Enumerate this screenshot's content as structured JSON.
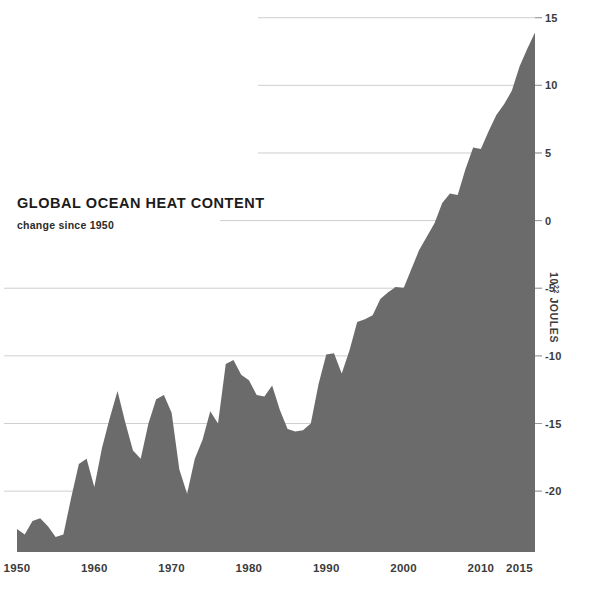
{
  "title": "GLOBAL OCEAN HEAT CONTENT",
  "subtitle": "change since 1950",
  "axis": {
    "y_label_prefix": "10",
    "y_label_exp": "22",
    "y_label_suffix": " JOULES",
    "y_label_full": "10²² JOULES"
  },
  "colors": {
    "fill": "#6b6b6b",
    "gridline": "#cfcfcf",
    "gridline_over_fill": "#4f4f4f",
    "text": "#3b3b3b",
    "title": "#1c1c1c",
    "background": "#ffffff"
  },
  "chart_data": {
    "type": "area",
    "title": "GLOBAL OCEAN HEAT CONTENT",
    "subtitle": "change since 1950",
    "xlabel": "",
    "ylabel": "10²² JOULES",
    "xlim": [
      1950,
      2017
    ],
    "ylim": [
      -24.5,
      15.2
    ],
    "grid": true,
    "legend": null,
    "xticks": [
      1950,
      1960,
      1970,
      1980,
      1990,
      2000,
      2010,
      2015
    ],
    "xtick_labels": [
      "1950",
      "1960",
      "1970",
      "1980",
      "1990",
      "2000",
      "2010",
      "2015"
    ],
    "yticks": [
      15,
      10,
      5,
      0,
      -5,
      -10,
      -15,
      -20
    ],
    "ytick_labels": [
      "15",
      "10",
      "5",
      "0",
      "-5",
      "-10",
      "-15",
      "-20"
    ],
    "x": [
      1950,
      1951,
      1952,
      1953,
      1954,
      1955,
      1956,
      1957,
      1958,
      1959,
      1960,
      1961,
      1962,
      1963,
      1964,
      1965,
      1966,
      1967,
      1968,
      1969,
      1970,
      1971,
      1972,
      1973,
      1974,
      1975,
      1976,
      1977,
      1978,
      1979,
      1980,
      1981,
      1982,
      1983,
      1984,
      1985,
      1986,
      1987,
      1988,
      1989,
      1990,
      1991,
      1992,
      1993,
      1994,
      1995,
      1996,
      1997,
      1998,
      1999,
      2000,
      2001,
      2002,
      2003,
      2004,
      2005,
      2006,
      2007,
      2008,
      2009,
      2010,
      2011,
      2012,
      2013,
      2014,
      2015,
      2016,
      2017
    ],
    "values": [
      -22.8,
      -23.2,
      -22.2,
      -22.0,
      -22.6,
      -23.4,
      -23.2,
      -20.5,
      -18.0,
      -17.6,
      -19.7,
      -16.8,
      -14.6,
      -12.6,
      -14.9,
      -17.0,
      -17.6,
      -15.0,
      -13.2,
      -12.9,
      -14.2,
      -18.4,
      -20.2,
      -17.6,
      -16.2,
      -14.1,
      -15.0,
      -10.6,
      -10.3,
      -11.4,
      -11.8,
      -12.9,
      -13.0,
      -12.2,
      -14.0,
      -15.4,
      -15.6,
      -15.5,
      -15.0,
      -12.1,
      -9.9,
      -9.8,
      -11.3,
      -9.6,
      -7.5,
      -7.3,
      -7.0,
      -5.8,
      -5.3,
      -4.9,
      -5.0,
      -3.6,
      -2.2,
      -1.2,
      -0.2,
      1.3,
      2.0,
      1.9,
      3.8,
      5.4,
      5.3,
      6.6,
      7.8,
      8.6,
      9.6,
      11.4,
      12.7,
      13.9
    ]
  }
}
